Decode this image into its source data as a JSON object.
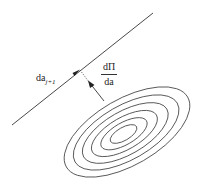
{
  "diagram": {
    "type": "gradient-descent-illustration",
    "line_label": {
      "base": "da",
      "subscript": "j+1"
    },
    "gradient_label": {
      "numerator": "dΠ",
      "denominator": "da"
    },
    "contour_count": 6,
    "colors": {
      "stroke": "#333333",
      "background": "#ffffff"
    }
  }
}
